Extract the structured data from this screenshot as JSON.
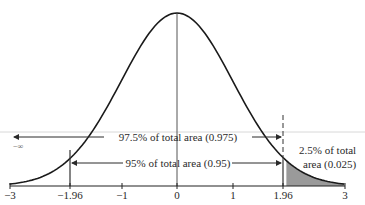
{
  "diagram": {
    "type": "standard-normal-distribution",
    "curve": {
      "color": "#1a1a1a",
      "peak_y": 13
    },
    "shaded_region": {
      "from": 1.96,
      "to": 3,
      "color": "#9a9a9a"
    },
    "axis": {
      "ticks": [
        {
          "value": -3,
          "label": "−3"
        },
        {
          "value": -1.96,
          "label": "−1.96"
        },
        {
          "value": -1,
          "label": "−1"
        },
        {
          "value": 0,
          "label": "0"
        },
        {
          "value": 1,
          "label": "1"
        },
        {
          "value": 1.96,
          "label": "1.96"
        },
        {
          "value": 3,
          "label": "3"
        }
      ]
    },
    "neg_infinity_label": "−∞",
    "annotations": {
      "area_975": "97.5% of total area (0.975)",
      "area_95": "95% of total area (0.95)",
      "tail_line1": "2.5% of total",
      "tail_line2": "area (0.025)"
    }
  }
}
